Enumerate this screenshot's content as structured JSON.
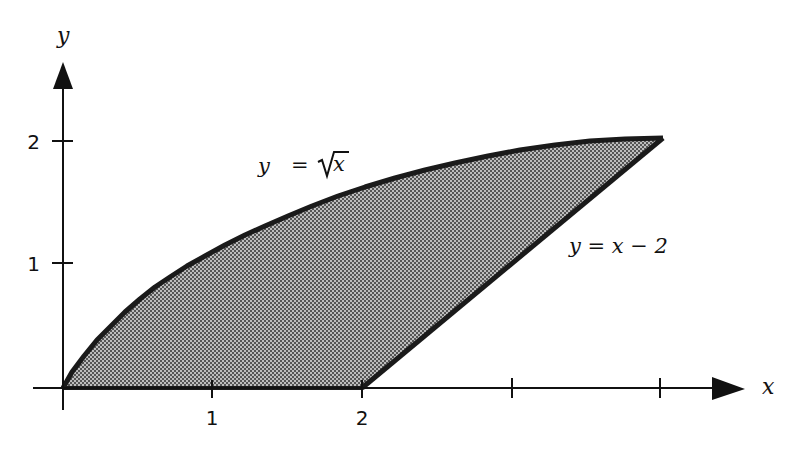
{
  "figure": {
    "x_axis_label": "x",
    "y_axis_label": "y",
    "x_ticks": [
      {
        "value": 1,
        "label": "1"
      },
      {
        "value": 2,
        "label": "2"
      },
      {
        "value": 3,
        "label": ""
      },
      {
        "value": 4,
        "label": ""
      }
    ],
    "y_ticks": [
      {
        "value": 1,
        "label": "1"
      },
      {
        "value": 2,
        "label": "2"
      }
    ],
    "curves": [
      {
        "name": "sqrt",
        "label_lhs": "y",
        "label_eq": "=",
        "label_rhs": "x",
        "label_full": "y = √x"
      },
      {
        "name": "line",
        "label_full": "y = x − 2",
        "label_lhs": "y",
        "label_eq": "=",
        "label_rhs": "x − 2"
      }
    ],
    "region": {
      "description": "Shaded region bounded by y = √x, y = x − 2, and the x-axis",
      "fill_color": "#8a8a8a",
      "vertices": [
        [
          0,
          0
        ],
        [
          2,
          0
        ],
        [
          4,
          2
        ]
      ]
    },
    "colors": {
      "axis": "#111111",
      "boundary": "#1a1a1a",
      "background": "#ffffff"
    }
  }
}
